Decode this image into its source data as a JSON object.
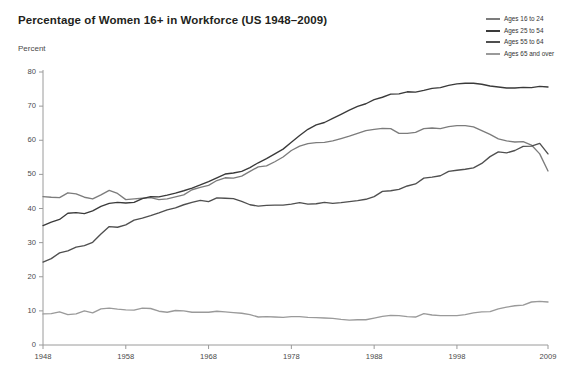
{
  "chart_data": {
    "type": "line",
    "title": "Percentage of Women 16+ in Workforce (US 1948–2009)",
    "ylabel": "Percent",
    "xlabel": "",
    "xlim": [
      1948,
      2009
    ],
    "ylim": [
      0,
      80
    ],
    "yticks": [
      0,
      10,
      20,
      30,
      40,
      50,
      60,
      70,
      80
    ],
    "xticks": [
      1948,
      1958,
      1968,
      1978,
      1988,
      1998,
      2009
    ],
    "grid": false,
    "legend_position": "top-right",
    "x": [
      1948,
      1949,
      1950,
      1951,
      1952,
      1953,
      1954,
      1955,
      1956,
      1957,
      1958,
      1959,
      1960,
      1961,
      1962,
      1963,
      1964,
      1965,
      1966,
      1967,
      1968,
      1969,
      1970,
      1971,
      1972,
      1973,
      1974,
      1975,
      1976,
      1977,
      1978,
      1979,
      1980,
      1981,
      1982,
      1983,
      1984,
      1985,
      1986,
      1987,
      1988,
      1989,
      1990,
      1991,
      1992,
      1993,
      1994,
      1995,
      1996,
      1997,
      1998,
      1999,
      2000,
      2001,
      2002,
      2003,
      2004,
      2005,
      2006,
      2007,
      2008,
      2009
    ],
    "series": [
      {
        "name": "Ages 16 to 24",
        "color": "#7c7c7c",
        "values": [
          43.5,
          43.3,
          43.2,
          44.6,
          44.3,
          43.3,
          42.8,
          44.0,
          45.3,
          44.4,
          42.6,
          42.8,
          43.0,
          43.2,
          42.6,
          42.8,
          43.4,
          44.0,
          45.5,
          46.2,
          46.8,
          48.2,
          49.0,
          48.9,
          49.5,
          50.9,
          52.2,
          52.5,
          53.7,
          55.1,
          57.0,
          58.3,
          59.0,
          59.3,
          59.4,
          59.8,
          60.5,
          61.2,
          62.0,
          62.8,
          63.2,
          63.5,
          63.4,
          62.0,
          62.0,
          62.3,
          63.4,
          63.6,
          63.4,
          64.0,
          64.3,
          64.3,
          63.9,
          62.8,
          61.7,
          60.4,
          59.8,
          59.5,
          59.6,
          58.6,
          56.0,
          51.0
        ]
      },
      {
        "name": "Ages 25 to 54",
        "color": "#3a3a3a",
        "values": [
          35.0,
          36.0,
          36.8,
          38.6,
          38.8,
          38.5,
          39.3,
          40.6,
          41.5,
          41.8,
          41.6,
          41.8,
          42.9,
          43.5,
          43.4,
          43.9,
          44.5,
          45.2,
          46.0,
          46.9,
          47.9,
          49.0,
          50.1,
          50.4,
          50.9,
          52.0,
          53.4,
          54.6,
          56.0,
          57.4,
          59.4,
          61.4,
          63.2,
          64.5,
          65.2,
          66.4,
          67.6,
          68.8,
          69.9,
          70.7,
          71.9,
          72.6,
          73.5,
          73.6,
          74.2,
          74.1,
          74.6,
          75.2,
          75.4,
          76.1,
          76.5,
          76.7,
          76.7,
          76.4,
          75.9,
          75.6,
          75.3,
          75.3,
          75.5,
          75.4,
          75.8,
          75.6
        ]
      },
      {
        "name": "Ages 55 to 64",
        "color": "#4f4f4f",
        "values": [
          24.3,
          25.3,
          27.0,
          27.6,
          28.7,
          29.1,
          30.1,
          32.5,
          34.7,
          34.5,
          35.2,
          36.6,
          37.2,
          37.9,
          38.7,
          39.6,
          40.2,
          41.1,
          41.8,
          42.4,
          42.0,
          43.1,
          43.0,
          42.9,
          42.1,
          41.1,
          40.7,
          40.9,
          41.0,
          41.0,
          41.3,
          41.7,
          41.3,
          41.4,
          41.8,
          41.5,
          41.7,
          42.0,
          42.3,
          42.7,
          43.5,
          45.0,
          45.2,
          45.6,
          46.6,
          47.2,
          48.9,
          49.2,
          49.6,
          50.9,
          51.2,
          51.5,
          51.9,
          53.2,
          55.2,
          56.6,
          56.3,
          57.0,
          58.2,
          58.3,
          59.1,
          56.0
        ]
      },
      {
        "name": "Ages 65 and over",
        "color": "#9a9a9a",
        "values": [
          9.1,
          9.2,
          9.7,
          8.9,
          9.1,
          10.0,
          9.4,
          10.6,
          10.8,
          10.5,
          10.3,
          10.2,
          10.8,
          10.7,
          9.9,
          9.6,
          10.1,
          10.0,
          9.6,
          9.6,
          9.6,
          9.9,
          9.7,
          9.5,
          9.3,
          8.9,
          8.2,
          8.3,
          8.2,
          8.1,
          8.3,
          8.3,
          8.1,
          8.0,
          7.9,
          7.8,
          7.5,
          7.3,
          7.4,
          7.4,
          7.9,
          8.4,
          8.7,
          8.6,
          8.3,
          8.2,
          9.2,
          8.8,
          8.6,
          8.6,
          8.6,
          8.9,
          9.4,
          9.7,
          9.8,
          10.6,
          11.1,
          11.5,
          11.7,
          12.6,
          12.8,
          12.6
        ]
      }
    ]
  }
}
